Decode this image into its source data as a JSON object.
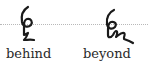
{
  "figure": {
    "baseline_style": "dotted",
    "ink_color": "#1a1a1a",
    "baseline_color": "#b8b8b8",
    "entries": [
      {
        "word": "behind",
        "glyph": "shorthand-behind-outline"
      },
      {
        "word": "beyond",
        "glyph": "shorthand-beyond-outline"
      }
    ]
  }
}
